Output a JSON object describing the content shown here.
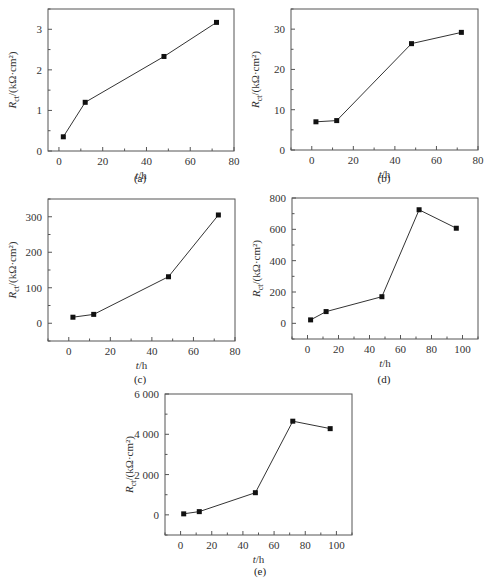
{
  "figure": {
    "panels": [
      {
        "id": "a",
        "caption": "(a)"
      },
      {
        "id": "b",
        "caption": "(b)"
      },
      {
        "id": "c",
        "caption": "(c)"
      },
      {
        "id": "d",
        "caption": "(d)"
      },
      {
        "id": "e",
        "caption": "(e)"
      }
    ]
  },
  "chart_data": [
    {
      "panel": "(a)",
      "type": "line",
      "xlabel": "t/h",
      "ylabel": "R_ct/(kΩ·cm²)",
      "xlim": [
        -5,
        80
      ],
      "ylim": [
        0,
        3.5
      ],
      "xticks": [
        0,
        20,
        40,
        60,
        80
      ],
      "yticks": [
        0,
        1,
        2,
        3
      ],
      "x": [
        2,
        12,
        48,
        72
      ],
      "values": [
        0.35,
        1.2,
        2.33,
        3.17
      ],
      "marker": "square",
      "grid": false
    },
    {
      "panel": "(b)",
      "type": "line",
      "xlabel": "t/h",
      "ylabel": "R_ct/(kΩ·cm²)",
      "xlim": [
        -10,
        80
      ],
      "ylim": [
        0,
        35
      ],
      "xticks": [
        0,
        20,
        40,
        60,
        80
      ],
      "yticks": [
        0,
        10,
        20,
        30
      ],
      "x": [
        2,
        12,
        48,
        72
      ],
      "values": [
        7.0,
        7.3,
        26.4,
        29.2
      ],
      "marker": "square",
      "grid": false
    },
    {
      "panel": "(c)",
      "type": "line",
      "xlabel": "t/h",
      "ylabel": "R_ct/(kΩ·cm²)",
      "xlim": [
        -10,
        80
      ],
      "ylim": [
        -50,
        350
      ],
      "xticks": [
        0,
        20,
        40,
        60,
        80
      ],
      "yticks": [
        0,
        100,
        200,
        300
      ],
      "x": [
        2,
        12,
        48,
        72
      ],
      "values": [
        17,
        25,
        131,
        305
      ],
      "marker": "square",
      "grid": false
    },
    {
      "panel": "(d)",
      "type": "line",
      "xlabel": "t/h",
      "ylabel": "R_ct/(kΩ·cm²)",
      "xlim": [
        -10,
        110
      ],
      "ylim": [
        -100,
        800
      ],
      "xticks": [
        0,
        20,
        40,
        60,
        80,
        100
      ],
      "yticks": [
        0,
        200,
        400,
        600,
        800
      ],
      "x": [
        2,
        12,
        48,
        72,
        96
      ],
      "values": [
        22,
        75,
        170,
        725,
        607
      ],
      "marker": "square",
      "grid": false
    },
    {
      "panel": "(e)",
      "type": "line",
      "xlabel": "t/h",
      "ylabel": "R_ct/(kΩ·cm²)",
      "xlim": [
        -10,
        110
      ],
      "ylim": [
        -1000,
        6000
      ],
      "xticks": [
        0,
        20,
        40,
        60,
        80,
        100
      ],
      "yticks": [
        0,
        2000,
        4000,
        6000
      ],
      "ytick_labels": [
        "0",
        "2 000",
        "4 000",
        "6 000"
      ],
      "x": [
        2,
        12,
        48,
        72,
        96
      ],
      "values": [
        50,
        160,
        1100,
        4650,
        4280
      ],
      "marker": "square",
      "grid": false
    }
  ]
}
